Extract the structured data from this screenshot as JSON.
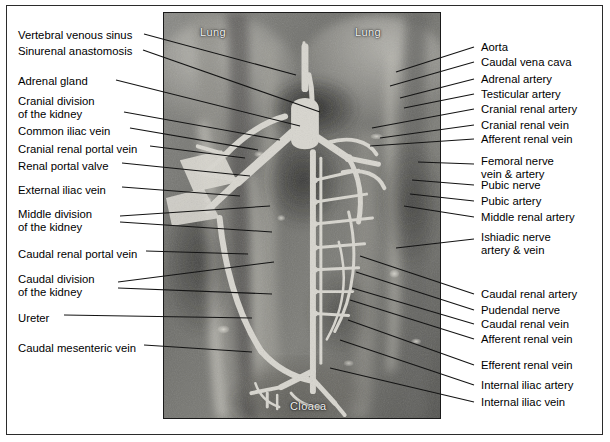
{
  "figure": {
    "photo_captions": [
      {
        "name": "lung-left",
        "text": "Lung"
      },
      {
        "name": "lung-right",
        "text": "Lung"
      },
      {
        "name": "cloaca",
        "text": "Cloaca"
      }
    ],
    "colors": {
      "frame_border": "#2b2b2b",
      "photo_border": "#1a1a1a",
      "leader_line": "#141414",
      "label_text": "#000000",
      "photo_caption_text": "#f2f2f2",
      "overlay_vessel": "#d8d6cf",
      "background": "#ffffff"
    },
    "left_labels": [
      {
        "id": "vertebral-venous-sinus",
        "lines": [
          "Vertebral venous sinus"
        ]
      },
      {
        "id": "sinurenal-anastomosis",
        "lines": [
          "Sinurenal anastomosis"
        ]
      },
      {
        "id": "adrenal-gland",
        "lines": [
          "Adrenal gland"
        ]
      },
      {
        "id": "cranial-division-kidney",
        "lines": [
          "Cranial division",
          "of the kidney"
        ]
      },
      {
        "id": "common-iliac-vein",
        "lines": [
          "Common iliac vein"
        ]
      },
      {
        "id": "cranial-renal-portal-vein",
        "lines": [
          "Cranial renal portal vein"
        ]
      },
      {
        "id": "renal-portal-valve",
        "lines": [
          "Renal portal valve"
        ]
      },
      {
        "id": "external-iliac-vein",
        "lines": [
          "External iliac vein"
        ]
      },
      {
        "id": "middle-division-kidney",
        "lines": [
          "Middle division",
          "of the kidney"
        ]
      },
      {
        "id": "caudal-renal-portal-vein",
        "lines": [
          "Caudal renal portal vein"
        ]
      },
      {
        "id": "caudal-division-kidney",
        "lines": [
          "Caudal division",
          "of the kidney"
        ]
      },
      {
        "id": "ureter",
        "lines": [
          "Ureter"
        ]
      },
      {
        "id": "caudal-mesenteric-vein",
        "lines": [
          "Caudal mesenteric vein"
        ]
      }
    ],
    "right_labels": [
      {
        "id": "aorta",
        "lines": [
          "Aorta"
        ]
      },
      {
        "id": "caudal-vena-cava",
        "lines": [
          "Caudal vena cava"
        ]
      },
      {
        "id": "adrenal-artery",
        "lines": [
          "Adrenal artery"
        ]
      },
      {
        "id": "testicular-artery",
        "lines": [
          "Testicular artery"
        ]
      },
      {
        "id": "cranial-renal-artery",
        "lines": [
          "Cranial renal artery"
        ]
      },
      {
        "id": "cranial-renal-vein",
        "lines": [
          "Cranial renal vein"
        ]
      },
      {
        "id": "afferent-renal-vein-upper",
        "lines": [
          "Afferent renal vein"
        ]
      },
      {
        "id": "femoral-nerve-vein-artery",
        "lines": [
          "Femoral nerve",
          "vein & artery"
        ]
      },
      {
        "id": "pubic-nerve",
        "lines": [
          "Pubic nerve"
        ]
      },
      {
        "id": "pubic-artery",
        "lines": [
          "Pubic artery"
        ]
      },
      {
        "id": "middle-renal-artery",
        "lines": [
          "Middle renal artery"
        ]
      },
      {
        "id": "ishiadic-nerve-artery-vein",
        "lines": [
          "Ishiadic nerve",
          "artery & vein"
        ]
      },
      {
        "id": "caudal-renal-artery",
        "lines": [
          "Caudal renal artery"
        ]
      },
      {
        "id": "pudendal-nerve",
        "lines": [
          "Pudendal nerve"
        ]
      },
      {
        "id": "caudal-renal-vein",
        "lines": [
          "Caudal renal vein"
        ]
      },
      {
        "id": "afferent-renal-vein-lower",
        "lines": [
          "Afferent renal vein"
        ]
      },
      {
        "id": "efferent-renal-vein",
        "lines": [
          "Efferent renal vein"
        ]
      },
      {
        "id": "internal-iliac-artery",
        "lines": [
          "Internal iliac artery"
        ]
      },
      {
        "id": "internal-iliac-vein",
        "lines": [
          "Internal iliac vein"
        ]
      }
    ]
  }
}
